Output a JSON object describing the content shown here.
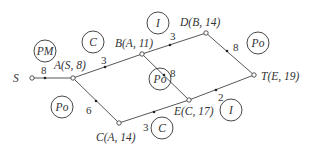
{
  "diagram": {
    "type": "network",
    "nodes": [
      {
        "id": "S",
        "label": "S",
        "x": 32,
        "y": 78
      },
      {
        "id": "A",
        "label": "A(S, 8)",
        "x": 73,
        "y": 78
      },
      {
        "id": "B",
        "label": "B(A, 11)",
        "x": 142,
        "y": 54
      },
      {
        "id": "D",
        "label": "D(B, 14)",
        "x": 206,
        "y": 33
      },
      {
        "id": "T",
        "label": "T(E, 19)",
        "x": 254,
        "y": 75
      },
      {
        "id": "E",
        "label": "E(C, 17)",
        "x": 189,
        "y": 100
      },
      {
        "id": "C",
        "label": "C(A, 14)",
        "x": 119,
        "y": 123
      }
    ],
    "edges": [
      {
        "from": "S",
        "to": "A",
        "weight": "8"
      },
      {
        "from": "A",
        "to": "B",
        "weight": "3"
      },
      {
        "from": "B",
        "to": "D",
        "weight": "3"
      },
      {
        "from": "D",
        "to": "T",
        "weight": "8"
      },
      {
        "from": "B",
        "to": "E",
        "weight": "8"
      },
      {
        "from": "A",
        "to": "C",
        "weight": "6"
      },
      {
        "from": "C",
        "to": "E",
        "weight": "3"
      },
      {
        "from": "E",
        "to": "T",
        "weight": "2"
      }
    ],
    "region_labels": [
      {
        "text": "PM",
        "x": 45,
        "y": 51
      },
      {
        "text": "C",
        "x": 93,
        "y": 42
      },
      {
        "text": "I",
        "x": 158,
        "y": 23
      },
      {
        "text": "Po",
        "x": 258,
        "y": 43
      },
      {
        "text": "Po",
        "x": 160,
        "y": 79
      },
      {
        "text": "Po",
        "x": 62,
        "y": 107
      },
      {
        "text": "C",
        "x": 162,
        "y": 128
      },
      {
        "text": "I",
        "x": 231,
        "y": 110
      }
    ]
  }
}
